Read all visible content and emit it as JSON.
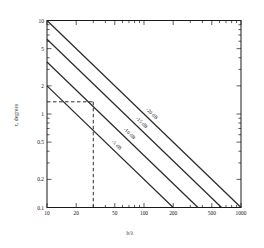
{
  "chart_data": {
    "type": "line",
    "title": "",
    "xlabel": "b/λ",
    "ylabel": "τ, degrees",
    "xscale": "log",
    "yscale": "log",
    "xlim": [
      10,
      1000
    ],
    "ylim": [
      0.1,
      10
    ],
    "grid": false,
    "legend_position": "inline-along-curves",
    "xticks": [
      10,
      20,
      50,
      100,
      200,
      500,
      1000
    ],
    "xticklabels": [
      "10",
      "20",
      "50",
      "100",
      "200",
      "500",
      "1000"
    ],
    "yticks": [
      0.1,
      0.2,
      0.5,
      1,
      2,
      5,
      10
    ],
    "yticklabels": [
      "0.1",
      "0.2",
      "0.5",
      "1",
      "2",
      "5",
      "10"
    ],
    "series": [
      {
        "name": "-5 dB",
        "label": "-5 dB",
        "x": [
          10,
          1000
        ],
        "y": [
          2.0,
          0.02
        ],
        "note": "slope -1 on log-log; visible segment from (10, 2.0) to (200, 0.1)"
      },
      {
        "name": "-10 dB",
        "label": "-10 dB",
        "x": [
          10,
          1000
        ],
        "y": [
          3.6,
          0.036
        ],
        "note": "slope -1 on log-log; visible segment from (10, 3.6) to (360, 0.1)"
      },
      {
        "name": "-15 dB",
        "label": "-15 dB",
        "x": [
          10,
          1000
        ],
        "y": [
          6.3,
          0.063
        ],
        "note": "slope -1 on log-log; visible segment from (10, 6.3) to (630, 0.1)"
      },
      {
        "name": "-20 dB",
        "label": "-20 dB",
        "x": [
          10,
          1000
        ],
        "y": [
          10.0,
          0.1
        ],
        "note": "slope -1 on log-log; visible segment from (10, 10) to (1000, 0.1)"
      }
    ],
    "annotations": [
      {
        "name": "construction-lines",
        "type": "dashed-crosshair",
        "x": 30,
        "y": 1.35,
        "description": "dashed horizontal line from y-axis to the -15 dB curve and dashed vertical line down to the x-axis at b/λ = 30"
      }
    ]
  },
  "labels": {
    "ylabel": "τ, degrees",
    "xlabel": "b/λ"
  }
}
